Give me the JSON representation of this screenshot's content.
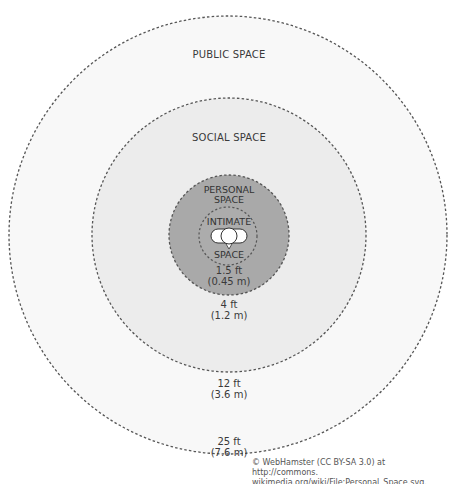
{
  "zones": {
    "public": {
      "title": "PUBLIC SPACE",
      "distance_ft": "25 ft",
      "distance_m": "(7.6 m)",
      "fill": "#f8f8f8"
    },
    "social": {
      "title": "SOCIAL SPACE",
      "distance_ft": "12 ft",
      "distance_m": "(3.6 m)",
      "fill": "#ececec"
    },
    "personal": {
      "title_line1": "PERSONAL",
      "title_line2": "SPACE",
      "distance_ft": "4 ft",
      "distance_m": "(1.2 m)",
      "fill": "#a9a9a9"
    },
    "intimate": {
      "title_line1": "INTIMATE",
      "title_line2": "SPACE",
      "distance_ft": "1.5 ft",
      "distance_m": "(0.45 m)",
      "fill": "#acacac"
    }
  },
  "border_color": "#555555",
  "person_icon": "person-top-view-icon",
  "credit": {
    "line1": "© WebHamster (CC BY-SA 3.0) at http://commons.",
    "line2": "wikimedia.org/wiki/File:Personal_Space.svg."
  }
}
